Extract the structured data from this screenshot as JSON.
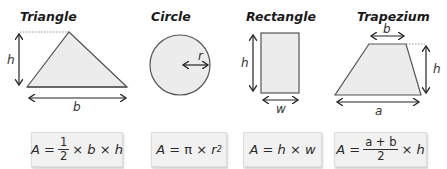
{
  "shapes": {
    "triangle": {
      "title": "Triangle",
      "labels": {
        "height": "h",
        "base": "b"
      },
      "formula": {
        "lhs": "A =",
        "numerator": "1",
        "denominator": "2",
        "rest": "× b × h"
      }
    },
    "circle": {
      "title": "Circle",
      "labels": {
        "radius": "r"
      },
      "formula": {
        "lhs": "A =",
        "pi": "π",
        "times": "×",
        "var": "r",
        "exp": "2"
      }
    },
    "rectangle": {
      "title": "Rectangle",
      "labels": {
        "height": "h",
        "width": "w"
      },
      "formula": {
        "text": "A = h × w"
      }
    },
    "trapezium": {
      "title": "Trapezium",
      "labels": {
        "top": "b",
        "height": "h",
        "bottom": "a"
      },
      "formula": {
        "lhs": "A =",
        "numerator": "a + b",
        "denominator": "2",
        "rest": "× h"
      }
    }
  },
  "colors": {
    "shape_fill": "#ececec",
    "shape_stroke": "#555555",
    "box_fill": "#f1f1f1"
  }
}
